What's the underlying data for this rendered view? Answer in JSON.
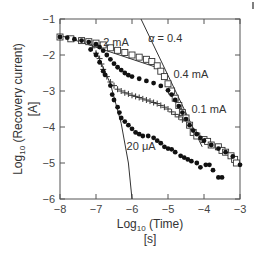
{
  "chart_data": {
    "type": "scatter",
    "title": "",
    "xlabel": "Log10 (Time)",
    "xlabel_unit": "[s]",
    "ylabel": "Log10 (Recovery current)",
    "ylabel_unit": "[A]",
    "xlim": [
      -8,
      -3
    ],
    "ylim": [
      -6,
      -1
    ],
    "x_ticks": [
      -8,
      -7,
      -6,
      -5,
      -4,
      -3
    ],
    "y_ticks": [
      -1,
      -2,
      -3,
      -4,
      -5,
      -6
    ],
    "grid": false,
    "legend": "inline annotations",
    "annotations": [
      {
        "text": "2 mA",
        "x": -6.8,
        "y": -1.75
      },
      {
        "text": "α = 0.4",
        "x": -5.55,
        "y": -1.65
      },
      {
        "text": "0.4 mA",
        "x": -4.85,
        "y": -2.65
      },
      {
        "text": "0.1 mA",
        "x": -4.35,
        "y": -3.6
      },
      {
        "text": "20 μA",
        "x": -6.15,
        "y": -4.65
      }
    ],
    "series": [
      {
        "name": "2 mA",
        "marker": "open-square",
        "x": [
          -8.0,
          -7.7,
          -7.4,
          -7.2,
          -7.0,
          -6.8,
          -6.6,
          -6.4,
          -6.2,
          -6.0,
          -5.8,
          -5.6,
          -5.45,
          -5.3,
          -5.2,
          -5.1,
          -5.0,
          -4.9,
          -4.8,
          -4.7,
          -4.6,
          -4.5,
          -4.4,
          -4.3,
          -4.2,
          -4.0,
          -3.9,
          -3.8,
          -3.6,
          -3.5,
          -3.4,
          -3.25,
          -3.15,
          -3.1
        ],
        "y": [
          -1.5,
          -1.55,
          -1.6,
          -1.63,
          -1.67,
          -1.72,
          -1.8,
          -1.87,
          -1.93,
          -2.0,
          -2.06,
          -2.12,
          -2.18,
          -2.3,
          -2.45,
          -2.6,
          -2.8,
          -3.0,
          -3.2,
          -3.4,
          -3.6,
          -3.75,
          -3.95,
          -4.15,
          -4.25,
          -4.35,
          -4.4,
          -4.5,
          -4.55,
          -4.65,
          -4.7,
          -4.8,
          -4.9,
          -5.0
        ]
      },
      {
        "name": "0.4 mA",
        "marker": "filled-circle",
        "x": [
          -8.0,
          -7.8,
          -7.6,
          -7.4,
          -7.2,
          -7.0,
          -6.9,
          -6.8,
          -6.7,
          -6.6,
          -6.5,
          -6.4,
          -6.3,
          -6.2,
          -6.1,
          -6.0,
          -5.8,
          -5.6,
          -5.4,
          -5.2,
          -5.0,
          -4.9,
          -4.8,
          -4.7,
          -4.6,
          -4.5,
          -4.4,
          -4.3,
          -4.2,
          -4.1,
          -4.0,
          -3.8,
          -3.6,
          -3.4,
          -3.2,
          -3.0
        ],
        "y": [
          -1.5,
          -1.52,
          -1.56,
          -1.6,
          -1.64,
          -1.7,
          -1.78,
          -1.88,
          -2.0,
          -2.12,
          -2.24,
          -2.34,
          -2.42,
          -2.5,
          -2.56,
          -2.6,
          -2.66,
          -2.72,
          -2.78,
          -2.86,
          -2.98,
          -3.1,
          -3.25,
          -3.42,
          -3.6,
          -3.78,
          -3.95,
          -4.1,
          -4.2,
          -4.3,
          -4.38,
          -4.5,
          -4.6,
          -4.7,
          -4.82,
          -5.05
        ]
      },
      {
        "name": "0.1 mA",
        "marker": "cross",
        "x": [
          -7.1,
          -7.0,
          -6.9,
          -6.85,
          -6.8,
          -6.7,
          -6.6,
          -6.5,
          -6.4,
          -6.3,
          -6.2,
          -6.1,
          -6.0,
          -5.9,
          -5.8,
          -5.7,
          -5.6,
          -5.5,
          -5.4,
          -5.3,
          -5.2,
          -5.1,
          -5.0,
          -4.9,
          -4.8,
          -4.7,
          -4.6
        ],
        "y": [
          -1.8,
          -1.95,
          -2.1,
          -2.25,
          -2.4,
          -2.6,
          -2.75,
          -2.85,
          -2.95,
          -3.0,
          -3.05,
          -3.08,
          -3.12,
          -3.15,
          -3.18,
          -3.22,
          -3.25,
          -3.28,
          -3.32,
          -3.35,
          -3.4,
          -3.45,
          -3.5,
          -3.58,
          -3.65,
          -3.72,
          -3.8
        ]
      },
      {
        "name": "20 μA",
        "marker": "filled-circle",
        "x": [
          -7.15,
          -7.0,
          -6.9,
          -6.8,
          -6.75,
          -6.6,
          -6.55,
          -6.5,
          -6.4,
          -6.35,
          -6.3,
          -6.2,
          -6.1,
          -6.0,
          -5.9,
          -5.8,
          -5.7,
          -5.55,
          -5.4,
          -5.3,
          -5.2,
          -5.1,
          -5.0,
          -4.9,
          -4.8,
          -4.65,
          -4.55,
          -4.45,
          -4.35,
          -4.2,
          -4.1,
          -3.95,
          -3.85,
          -3.75,
          -3.6,
          -3.5
        ],
        "y": [
          -1.85,
          -2.0,
          -2.2,
          -2.45,
          -2.55,
          -2.85,
          -3.1,
          -3.25,
          -3.45,
          -3.6,
          -3.75,
          -3.85,
          -3.95,
          -4.05,
          -4.15,
          -4.2,
          -4.25,
          -4.25,
          -4.3,
          -4.38,
          -4.45,
          -4.55,
          -4.6,
          -4.62,
          -4.7,
          -4.8,
          -4.85,
          -4.9,
          -4.95,
          -5.0,
          -5.12,
          -5.05,
          -5.05,
          -5.2,
          -5.4,
          -5.4
        ]
      }
    ],
    "reference_lines": [
      {
        "name": "slope-line-shallow",
        "x": [
          -8.0,
          -5.3
        ],
        "y": [
          -1.45,
          -2.35
        ]
      },
      {
        "name": "alpha-0.4-line",
        "x": [
          -5.75,
          -4.05
        ],
        "y": [
          -1.0,
          -4.55
        ]
      },
      {
        "name": "steep-curve-line",
        "x": [
          -7.0,
          -6.6,
          -6.3,
          -6.1,
          -6.0
        ],
        "y": [
          -1.9,
          -2.8,
          -3.9,
          -5.0,
          -6.0
        ]
      }
    ]
  }
}
